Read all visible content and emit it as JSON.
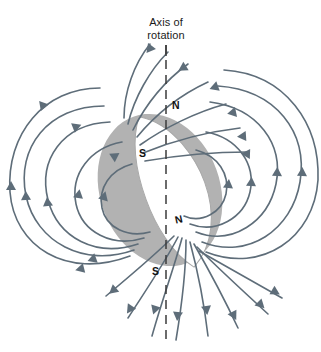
{
  "figure": {
    "title_lines": [
      "Axis of",
      "rotation"
    ],
    "axis": {
      "name": "axis-of-rotation",
      "style": "dashed",
      "x": 166,
      "y_top": 45,
      "y_bottom": 345,
      "color": "#3b3b3b"
    },
    "body": {
      "name": "rotating-sphere",
      "fill": "#b2b2b2",
      "cx": 160,
      "cy": 190,
      "rx": 60,
      "ry": 76,
      "tilt_deg": -20
    },
    "magnet": {
      "name": "magnet-lens",
      "fill": "#ffffff",
      "stroke": "#9a9a9a",
      "tilt_deg": -20
    },
    "poles": [
      {
        "label": "N",
        "position": "upper-right-of-axis"
      },
      {
        "label": "S",
        "position": "upper-left-on-magnet"
      },
      {
        "label": "N",
        "position": "lower-right-on-magnet"
      },
      {
        "label": "S",
        "position": "lower-left-of-axis"
      }
    ],
    "field_lines": {
      "name": "magnetic-field-lines",
      "color": "#5e6d79",
      "stroke_width": 1.6,
      "arrowheads": true,
      "description": "Dipole magnetic field loops emerging from the lower N pole and entering the upper S pole of the tilted magnet"
    },
    "background": "#ffffff"
  }
}
